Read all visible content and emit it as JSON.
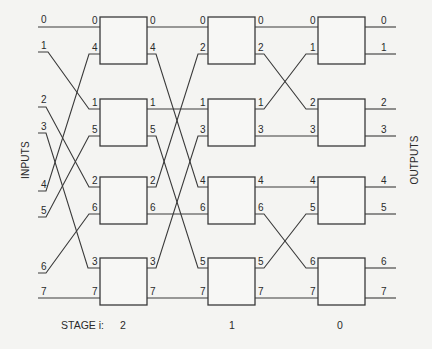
{
  "labels": {
    "inputs": "INPUTS",
    "outputs": "OUTPUTS",
    "stage_prefix": "STAGE i:"
  },
  "stages": [
    {
      "index": "2",
      "label": "2"
    },
    {
      "index": "1",
      "label": "1"
    },
    {
      "index": "0",
      "label": "0"
    }
  ],
  "inputs": [
    "0",
    "1",
    "2",
    "3",
    "4",
    "5",
    "6",
    "7"
  ],
  "outputs": [
    "0",
    "1",
    "2",
    "3",
    "4",
    "5",
    "6",
    "7"
  ],
  "switches": {
    "stage2": [
      {
        "in": [
          "0",
          "4"
        ],
        "out": [
          "0",
          "4"
        ]
      },
      {
        "in": [
          "1",
          "5"
        ],
        "out": [
          "1",
          "5"
        ]
      },
      {
        "in": [
          "2",
          "6"
        ],
        "out": [
          "2",
          "6"
        ]
      },
      {
        "in": [
          "3",
          "7"
        ],
        "out": [
          "3",
          "7"
        ]
      }
    ],
    "stage1": [
      {
        "in": [
          "0",
          "2"
        ],
        "out": [
          "0",
          "2"
        ]
      },
      {
        "in": [
          "1",
          "3"
        ],
        "out": [
          "1",
          "3"
        ]
      },
      {
        "in": [
          "4",
          "6"
        ],
        "out": [
          "4",
          "6"
        ]
      },
      {
        "in": [
          "5",
          "7"
        ],
        "out": [
          "5",
          "7"
        ]
      }
    ],
    "stage0": [
      {
        "in": [
          "0",
          "1"
        ],
        "out": [
          "0",
          "1"
        ]
      },
      {
        "in": [
          "2",
          "3"
        ],
        "out": [
          "2",
          "3"
        ]
      },
      {
        "in": [
          "4",
          "5"
        ],
        "out": [
          "4",
          "5"
        ]
      },
      {
        "in": [
          "6",
          "7"
        ],
        "out": [
          "6",
          "7"
        ]
      }
    ]
  },
  "colors": {
    "line": "#3a3a3a",
    "background": "#f4f4f2",
    "text": "#2a2a2a"
  }
}
